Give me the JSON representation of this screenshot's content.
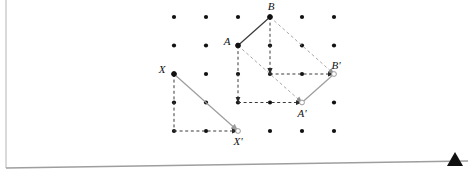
{
  "page": {
    "background": "#ffffff",
    "width": 472,
    "height": 181,
    "border_color": "#b8b8b8",
    "marker_color": "#101010"
  },
  "figure": {
    "grid": {
      "columns": 6,
      "rows": 5,
      "origin_x": 174,
      "origin_y": 17,
      "spacing_x": 32,
      "spacing_y": 28.5,
      "dot_color": "#111111",
      "dot_radius": 2.1
    },
    "colors": {
      "solid_dark": "#3a3a3a",
      "solid_gray": "#9d9d9d",
      "dashed": "#3a3a3a",
      "dashed_gray": "#a8a8a8",
      "open_point": "#9d9d9d"
    },
    "points": [
      {
        "name": "A",
        "label": "A",
        "col": 3,
        "row": 2,
        "x": 238,
        "y": 45.5,
        "label_dx": -11,
        "label_dy": -1
      },
      {
        "name": "B",
        "label": "B",
        "col": 4,
        "row": 1,
        "x": 270,
        "y": 17,
        "label_dx": 1,
        "label_dy": -7
      },
      {
        "name": "Ap",
        "label": "A'",
        "col": 5,
        "row": 4,
        "x": 302,
        "y": 102.5,
        "label_dx": 0,
        "label_dy": 14
      },
      {
        "name": "Bp",
        "label": "B'",
        "col": 6,
        "row": 3,
        "x": 334,
        "y": 74,
        "label_dx": 2,
        "label_dy": -5
      },
      {
        "name": "X",
        "label": "X",
        "col": 1,
        "row": 3,
        "x": 174,
        "y": 74,
        "label_dx": -12,
        "label_dy": -1
      },
      {
        "name": "Xp",
        "label": "X'",
        "col": 3,
        "row": 5,
        "x": 238,
        "y": 131,
        "label_dx": 0,
        "label_dy": 14
      }
    ],
    "segments": [
      {
        "name": "segment-A-B",
        "from": "A",
        "to": "B",
        "style": "solid",
        "color": "#3a3a3a",
        "arrow": false
      },
      {
        "name": "segment-Ap-Bp",
        "from": "Ap",
        "to": "Bp",
        "style": "solid",
        "color": "#9d9d9d",
        "arrow": false
      },
      {
        "name": "vector-X-Xp",
        "from": "X",
        "to": "Xp",
        "style": "solid",
        "color": "#9d9d9d",
        "arrow": true
      }
    ],
    "vectors": [
      {
        "name": "vector-A-down",
        "x1": 238,
        "y1": 45.5,
        "x2": 238,
        "y2": 102.5,
        "color": "#3a3a3a",
        "arrow": true
      },
      {
        "name": "vector-A-right",
        "x1": 238,
        "y1": 102.5,
        "x2": 302,
        "y2": 102.5,
        "color": "#3a3a3a",
        "arrow": true
      },
      {
        "name": "vector-A-diagonal",
        "x1": 238,
        "y1": 45.5,
        "x2": 302,
        "y2": 102.5,
        "color": "#a8a8a8",
        "arrow": true
      },
      {
        "name": "vector-B-down",
        "x1": 270,
        "y1": 17,
        "x2": 270,
        "y2": 74,
        "color": "#3a3a3a",
        "arrow": true
      },
      {
        "name": "vector-B-right",
        "x1": 270,
        "y1": 74,
        "x2": 334,
        "y2": 74,
        "color": "#3a3a3a",
        "arrow": true
      },
      {
        "name": "vector-B-diagonal",
        "x1": 270,
        "y1": 17,
        "x2": 334,
        "y2": 74,
        "color": "#a8a8a8",
        "arrow": true
      },
      {
        "name": "vector-X-down",
        "x1": 174,
        "y1": 74,
        "x2": 174,
        "y2": 131,
        "color": "#3a3a3a",
        "arrow": false
      },
      {
        "name": "vector-X-right",
        "x1": 174,
        "y1": 131,
        "x2": 238,
        "y2": 131,
        "color": "#3a3a3a",
        "arrow": true
      }
    ]
  }
}
